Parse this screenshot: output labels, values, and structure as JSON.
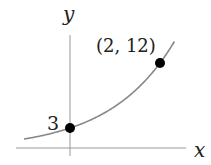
{
  "chart_data": {
    "type": "line",
    "title": "",
    "xlabel": "x",
    "ylabel": "y",
    "function": "y = 3 * 2^x",
    "series": [
      {
        "name": "exponential curve",
        "x": [
          -1,
          -0.5,
          0,
          0.5,
          1,
          1.5,
          2,
          2.33
        ],
        "values": [
          1.5,
          2.12,
          3,
          4.24,
          6,
          8.49,
          12,
          15.1
        ]
      }
    ],
    "points": [
      {
        "x": 0,
        "y": 3,
        "label": "3"
      },
      {
        "x": 2,
        "y": 12,
        "label": "(2, 12)"
      }
    ],
    "grid": false,
    "legend": null,
    "colors": {
      "curve": "#888888",
      "axes": "#999999",
      "points": "#000000",
      "text": "#222222"
    }
  },
  "labels": {
    "x_axis": "x",
    "y_axis": "y",
    "y_intercept": "3",
    "point": "(2, 12)"
  }
}
